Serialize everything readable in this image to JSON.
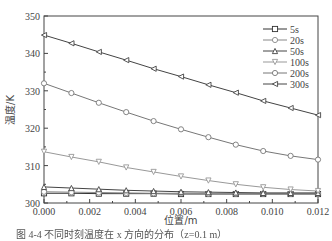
{
  "chart_data": {
    "type": "line",
    "title": "",
    "xlabel": "位置/m",
    "ylabel": "温度/K",
    "xlim": [
      0.0,
      0.012
    ],
    "ylim": [
      300,
      350
    ],
    "x_ticks": [
      "0.000",
      "0.002",
      "0.004",
      "0.006",
      "0.008",
      "0.010",
      "0.012"
    ],
    "y_ticks": [
      "300",
      "310",
      "320",
      "330",
      "340",
      "350"
    ],
    "grid": false,
    "legend_position": "upper right",
    "x": [
      0.0,
      0.0012,
      0.0024,
      0.0036,
      0.0048,
      0.006,
      0.0072,
      0.0084,
      0.0096,
      0.0108,
      0.012
    ],
    "series": [
      {
        "name": "5s",
        "marker": "square",
        "color": "#333333",
        "values": [
          302.6,
          302.6,
          302.5,
          302.5,
          302.5,
          302.4,
          302.4,
          302.4,
          302.4,
          302.4,
          302.4
        ]
      },
      {
        "name": "20s",
        "marker": "circle",
        "color": "#888888",
        "values": [
          303.0,
          302.9,
          302.8,
          302.7,
          302.6,
          302.6,
          302.5,
          302.5,
          302.5,
          302.5,
          302.5
        ]
      },
      {
        "name": "50s",
        "marker": "triangle-up",
        "color": "#444444",
        "values": [
          304.3,
          304.0,
          303.7,
          303.4,
          303.2,
          303.0,
          302.9,
          302.8,
          302.7,
          302.7,
          302.7
        ]
      },
      {
        "name": "100s",
        "marker": "triangle-down",
        "color": "#999999",
        "values": [
          313.7,
          312.3,
          311.0,
          309.5,
          308.3,
          307.1,
          306.0,
          305.0,
          304.2,
          303.6,
          303.2
        ]
      },
      {
        "name": "200s",
        "marker": "circle",
        "color": "#777777",
        "values": [
          332.0,
          329.4,
          326.8,
          324.3,
          321.9,
          319.7,
          317.6,
          315.6,
          313.9,
          312.6,
          311.6
        ]
      },
      {
        "name": "300s",
        "marker": "triangle-left",
        "color": "#444444",
        "values": [
          344.9,
          342.7,
          340.4,
          338.2,
          335.9,
          333.8,
          331.6,
          329.5,
          327.3,
          325.4,
          323.5
        ]
      }
    ]
  },
  "caption": "图 4-4  不同时刻温度在 x 方向的分布（z=0.1 m）"
}
